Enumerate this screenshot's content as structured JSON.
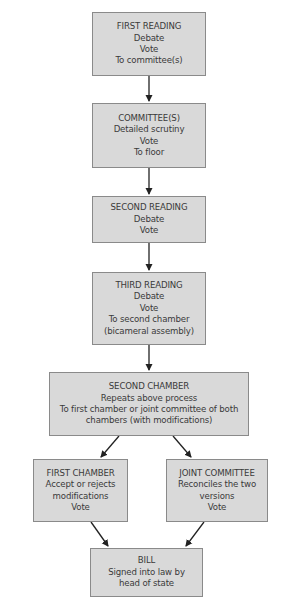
{
  "diagram": {
    "type": "flowchart",
    "colors": {
      "box_fill": "#d9d9d9",
      "box_border": "#8a8a8a",
      "text": "#3a3a3a",
      "arrow": "#222222"
    },
    "nodes": {
      "first_reading": {
        "title": "FIRST READING",
        "line1": "Debate",
        "line2": "Vote",
        "line3": "To committee(s)"
      },
      "committee": {
        "title": "COMMITTEE(S)",
        "line1": "Detailed scrutiny",
        "line2": "Vote",
        "line3": "To floor"
      },
      "second_reading": {
        "title": "SECOND READING",
        "line1": "Debate",
        "line2": "Vote"
      },
      "third_reading": {
        "title": "THIRD READING",
        "line1": "Debate",
        "line2": "Vote",
        "line3": "To second chamber",
        "line4": "(bicameral assembly)"
      },
      "second_chamber": {
        "title": "SECOND CHAMBER",
        "line1": "Repeats above process",
        "line2": "To first chamber or joint committee of both",
        "line3": "chambers (with modifications)"
      },
      "first_chamber": {
        "title": "FIRST CHAMBER",
        "line1": "Accept or rejects",
        "line2": "modifications",
        "line3": "Vote"
      },
      "joint_committee": {
        "title": "JOINT COMMITTEE",
        "line1": "Reconciles the two",
        "line2": "versions",
        "line3": "Vote"
      },
      "bill": {
        "title": "BILL",
        "line1": "Signed into law by",
        "line2": "head of state"
      }
    },
    "edges": [
      [
        "first_reading",
        "committee"
      ],
      [
        "committee",
        "second_reading"
      ],
      [
        "second_reading",
        "third_reading"
      ],
      [
        "third_reading",
        "second_chamber"
      ],
      [
        "second_chamber",
        "first_chamber"
      ],
      [
        "second_chamber",
        "joint_committee"
      ],
      [
        "first_chamber",
        "bill"
      ],
      [
        "joint_committee",
        "bill"
      ]
    ]
  }
}
